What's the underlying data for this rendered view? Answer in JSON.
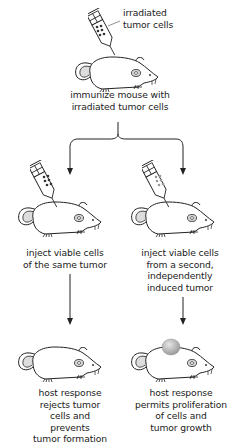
{
  "diagram": {
    "top": {
      "syringe_label": [
        "irradiated",
        "tumor cells"
      ],
      "caption": [
        "immunize mouse with",
        "irradiated tumor cells"
      ]
    },
    "left_branch": {
      "injection_caption": [
        "inject viable cells",
        "of the same tumor"
      ],
      "outcome_caption": [
        "host response",
        "rejects tumor",
        "cells and",
        "prevents",
        "tumor formation"
      ],
      "syringe_dot_color": "#333333"
    },
    "right_branch": {
      "injection_caption": [
        "inject viable cells",
        "from a second,",
        "independently",
        "induced tumor"
      ],
      "outcome_caption": [
        "host response",
        "permits proliferation",
        "of cells and",
        "tumor growth"
      ],
      "syringe_dot_color": "#999999",
      "tumor_color": "#b8b8b8"
    }
  }
}
